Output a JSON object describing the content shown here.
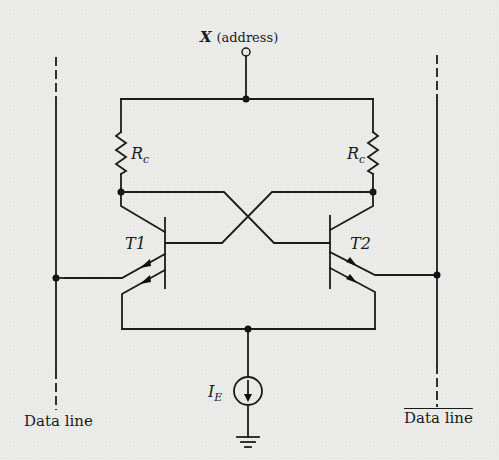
{
  "diagram": {
    "address_terminal": {
      "label": "X",
      "suffix": "(address)"
    },
    "resistors": [
      {
        "id": "left",
        "label": "R",
        "subscript": "c"
      },
      {
        "id": "right",
        "label": "R",
        "subscript": "c"
      }
    ],
    "transistors": [
      {
        "id": "T1",
        "label": "T1"
      },
      {
        "id": "T2",
        "label": "T2"
      }
    ],
    "current_source": {
      "label": "I",
      "subscript": "E"
    },
    "data_lines": [
      {
        "id": "left",
        "label": "Data line",
        "complement": false
      },
      {
        "id": "right",
        "label": "Data line",
        "complement": true
      }
    ],
    "colors": {
      "ink": "#1c1c1c",
      "paper": "#ebebea"
    }
  }
}
